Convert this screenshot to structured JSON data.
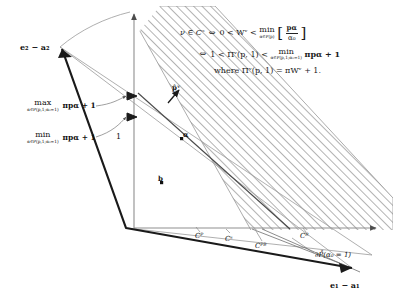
{
  "figure": {
    "caption": ""
  },
  "axes": {
    "vertical_tick_label": "1",
    "origin_label": ""
  },
  "vectors": {
    "top_left": "e₂ − a₂",
    "bottom_right": "e₁ − a₁"
  },
  "points": {
    "p_hat": "p̂ᵛ",
    "alpha": "α",
    "b": "b"
  },
  "annotations": {
    "max": {
      "op": "max",
      "under": "α∈P(p,1;α₀=1)",
      "expr": "πpα + 1"
    },
    "min": {
      "op": "min",
      "under": "α∈P(p,1;α₀=1)",
      "expr": "πpα + 1"
    }
  },
  "cones": {
    "c_p": "Cᴾ",
    "c_s": "Cˢ",
    "c_pb": "Cᴾᴮ",
    "c_r": "Cᴿ",
    "boundary": "∂P̊(α₀ = 1)"
  },
  "formula": {
    "line1": {
      "lhs": "ν ∈ Cˢ",
      "iff": "⇔",
      "mid": "0 < Wᵛ <",
      "op": "min",
      "under": "α∈P(p)",
      "bracket_open": "[",
      "numerator": "pα",
      "denominator": "α₀",
      "bracket_close": "]"
    },
    "line2": {
      "iff": "⇔",
      "mid": "1 < Πᵛ(p, 1) <",
      "op": "min",
      "under": "α∈P(p,1;α₀=1)",
      "expr": "πpα + 1"
    },
    "line3": {
      "text": "where Πᵛ(p, 1) = πWᵛ + 1."
    }
  },
  "colors": {
    "stroke_dark": "#1a1a1a",
    "stroke_light": "#8a8a8a",
    "hatch": "#6b6b6b",
    "background": "#ffffff"
  }
}
